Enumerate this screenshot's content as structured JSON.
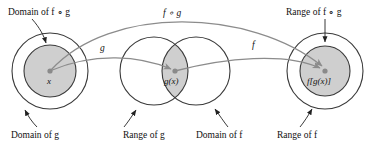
{
  "figure": {
    "title_alt": "Composition of functions f and g diagram",
    "colors": {
      "stroke": "#3a3a3a",
      "arc": "#8c8c8c",
      "fill_shaded": "#cfcfcf",
      "dot": "#8a8a8a",
      "text": "#111111",
      "background": "#ffffff"
    },
    "callouts": {
      "domain_fog": "Domain of f ∘ g",
      "range_fog": "Range of f ∘ g",
      "domain_g": "Domain of g",
      "range_g": "Range of g",
      "domain_f": "Domain of f",
      "range_f": "Range of f"
    },
    "arc_labels": {
      "composition": "f ∘ g",
      "g_map": "g",
      "f_map": "f"
    },
    "point_labels": {
      "input": "x",
      "middle": "g(x)",
      "output": "f[g(x)]"
    },
    "geometry": {
      "left_outer": {
        "cx": 50,
        "cy": 71,
        "r": 38
      },
      "left_inner": {
        "cx": 50,
        "cy": 71,
        "r": 26
      },
      "mid_left": {
        "cx": 154,
        "cy": 71,
        "r": 34
      },
      "mid_right": {
        "cx": 196,
        "cy": 71,
        "r": 34
      },
      "right_outer": {
        "cx": 325,
        "cy": 71,
        "r": 38
      },
      "right_inner": {
        "cx": 325,
        "cy": 71,
        "r": 25
      },
      "dot_x": {
        "cx": 50,
        "cy": 71
      },
      "dot_gx": {
        "cx": 175,
        "cy": 71
      },
      "dot_fgx": {
        "cx": 325,
        "cy": 71
      }
    }
  }
}
